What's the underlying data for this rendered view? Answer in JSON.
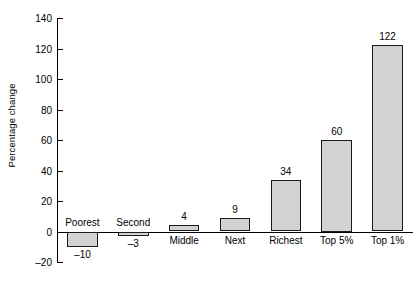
{
  "chart_data": {
    "type": "bar",
    "title": "",
    "xlabel": "",
    "ylabel": "Percentage change",
    "ylim": [
      -20,
      140
    ],
    "ytick_values": [
      -20,
      0,
      20,
      40,
      60,
      80,
      100,
      120,
      140
    ],
    "ytick_labels": [
      "–20",
      "0",
      "20",
      "40",
      "60",
      "80",
      "100",
      "120",
      "140"
    ],
    "grid": false,
    "legend": null,
    "categories": [
      "Poorest",
      "Second",
      "Middle",
      "Next",
      "Richest",
      "Top 5%",
      "Top 1%"
    ],
    "values": [
      -10,
      -3,
      4,
      9,
      34,
      60,
      122
    ],
    "value_labels": [
      "–10",
      "–3",
      "4",
      "9",
      "34",
      "60",
      "122"
    ],
    "bar_fill": "#d2d2d2",
    "bar_edge": "#1a1a1a",
    "axis_color": "#000000"
  }
}
